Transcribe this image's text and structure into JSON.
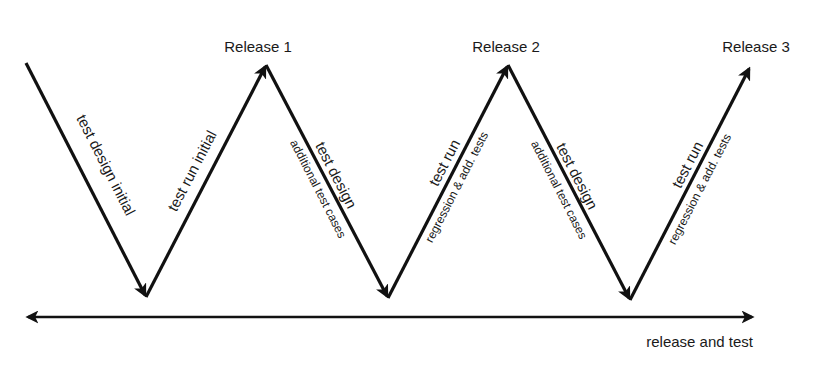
{
  "diagram": {
    "title": "",
    "releases": [
      {
        "label": "Release 1"
      },
      {
        "label": "Release 2"
      },
      {
        "label": "Release 3"
      }
    ],
    "phases": [
      {
        "main": "test design initial",
        "sub": ""
      },
      {
        "main": "test run initial",
        "sub": ""
      },
      {
        "main": "test design",
        "sub": "additional test cases"
      },
      {
        "main": "test run",
        "sub": "regression & add. tests"
      },
      {
        "main": "test design",
        "sub": "additional test cases"
      },
      {
        "main": "test run",
        "sub": "regression & add. tests"
      }
    ],
    "timeline": {
      "label": "release and test"
    },
    "colors": {
      "line": "#111111",
      "text": "#1a1a1a",
      "background": "#ffffff"
    }
  }
}
